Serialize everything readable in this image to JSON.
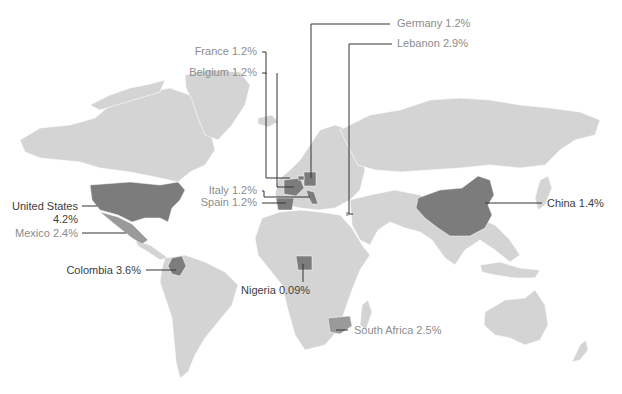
{
  "map": {
    "type": "choropleth world map",
    "colors": {
      "land": "#d4d4d4",
      "highlight_dark": "#7c7c7c",
      "highlight_mid": "#9a9a9a",
      "leader": "#333333",
      "label_dark": "#3d3d3d",
      "label_light": "#8c8c8c",
      "background": "#ffffff"
    },
    "labels": {
      "germany": "Germany 1.2%",
      "lebanon": "Lebanon 2.9%",
      "france": "France 1.2%",
      "belgium": "Belgium 1.2%",
      "italy": "Italy 1.2%",
      "spain": "Spain 1.2%",
      "united_states_line1": "United States",
      "united_states_line2": "4.2%",
      "mexico": "Mexico 2.4%",
      "colombia": "Colombia 3.6%",
      "nigeria": "Nigeria 0.09%",
      "south_africa": "South Africa 2.5%",
      "china": "China 1.4%"
    },
    "countries": [
      {
        "name": "Germany",
        "value": "1.2%"
      },
      {
        "name": "Lebanon",
        "value": "2.9%"
      },
      {
        "name": "France",
        "value": "1.2%"
      },
      {
        "name": "Belgium",
        "value": "1.2%"
      },
      {
        "name": "Italy",
        "value": "1.2%"
      },
      {
        "name": "Spain",
        "value": "1.2%"
      },
      {
        "name": "United States",
        "value": "4.2%"
      },
      {
        "name": "Mexico",
        "value": "2.4%"
      },
      {
        "name": "Colombia",
        "value": "3.6%"
      },
      {
        "name": "Nigeria",
        "value": "0.09%"
      },
      {
        "name": "South Africa",
        "value": "2.5%"
      },
      {
        "name": "China",
        "value": "1.4%"
      }
    ]
  }
}
